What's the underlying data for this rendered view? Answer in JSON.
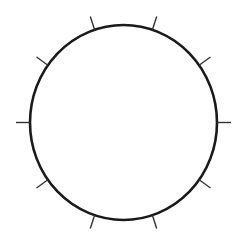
{
  "diagram": {
    "type": "circle-with-ticks",
    "background": "#ffffff",
    "stroke_color": "#1a1a1a",
    "tick_color": "#333333",
    "center": [
      123.5,
      122.5
    ],
    "radius_x": 93.5,
    "radius_y": 97.5,
    "circle_stroke_width": 2.6,
    "tick_count": 10,
    "tick_length": 14,
    "tick_stroke_width": 1.4,
    "tick_angles_deg": [
      0,
      36,
      72,
      108,
      144,
      180,
      216,
      252,
      288,
      324
    ]
  }
}
